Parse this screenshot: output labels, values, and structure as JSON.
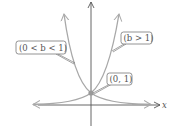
{
  "diagram": {
    "type": "exponential-graphs",
    "axes": {
      "x_label": "x",
      "y_label": "y"
    },
    "curves": [
      {
        "name": "decay",
        "condition": "(0 < b < 1)"
      },
      {
        "name": "growth",
        "condition": "(b > 1)"
      }
    ],
    "labels": {
      "decay": "(0 < b < 1)",
      "growth": "(b > 1)",
      "intercept": "(0, 1)"
    },
    "intercept_point": "(0, 1)",
    "colors": {
      "curve": "#a8a8a8",
      "axis": "#555555",
      "box": "#666666"
    }
  }
}
